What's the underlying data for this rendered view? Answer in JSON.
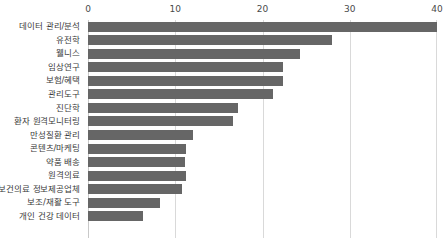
{
  "chart_data": {
    "type": "bar",
    "orientation": "horizontal",
    "title": "",
    "subtitle": "",
    "xlabel": "",
    "ylabel": "",
    "xlim": [
      0,
      40
    ],
    "ylim": null,
    "grid": true,
    "grid_axis": "x",
    "legend": false,
    "legend_position": "none",
    "axis_position": "top",
    "bar_color": "#666666",
    "gridline_color": "#d9d9d9",
    "tick_labels": [
      "0",
      "10",
      "20",
      "30",
      "40"
    ],
    "ticks": [
      0,
      10,
      20,
      30,
      40
    ],
    "categories": [
      "데이터 관리/분석",
      "유전학",
      "웰니스",
      "임상연구",
      "보험/혜택",
      "관리도구",
      "진단학",
      "환자 원격모니터링",
      "만성질환 관리",
      "콘텐츠/마케팅",
      "약품 배송",
      "원격의료",
      "보건의료 정보제공업체",
      "보조/재활 도구",
      "개인 건강 데이터"
    ],
    "values": [
      40,
      28,
      24.3,
      22.4,
      22.4,
      21.2,
      17.2,
      16.6,
      12.0,
      11.2,
      11.1,
      11.2,
      10.8,
      8.3,
      6.3
    ]
  }
}
